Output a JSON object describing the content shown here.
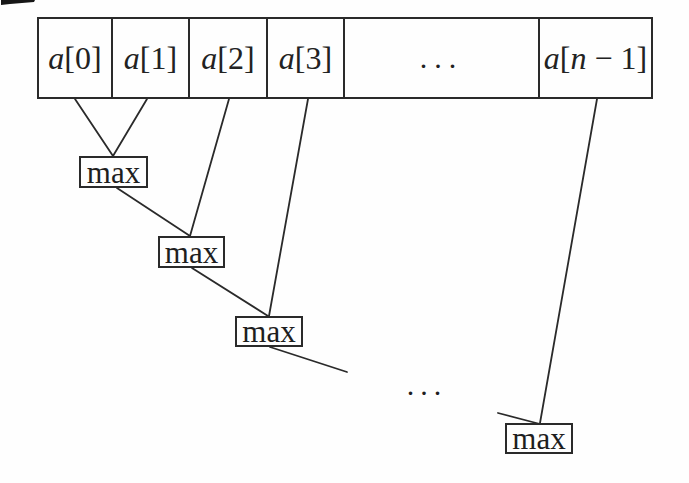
{
  "diagram": {
    "array": {
      "cells": [
        {
          "label": "a[0]"
        },
        {
          "label": "a[1]"
        },
        {
          "label": "a[2]"
        },
        {
          "label": "a[3]"
        },
        {
          "label": "..."
        },
        {
          "label": "a[n − 1]"
        }
      ]
    },
    "max_nodes": [
      {
        "label": "max"
      },
      {
        "label": "max"
      },
      {
        "label": "max"
      },
      {
        "label": "max"
      }
    ],
    "chain_ellipsis": "...",
    "edges": [
      {
        "from": "a[0]",
        "to": "max-1"
      },
      {
        "from": "a[1]",
        "to": "max-1"
      },
      {
        "from": "a[2]",
        "to": "max-2"
      },
      {
        "from": "max-1",
        "to": "max-2"
      },
      {
        "from": "a[3]",
        "to": "max-3"
      },
      {
        "from": "max-2",
        "to": "max-3"
      },
      {
        "from": "max-3",
        "to": "ellipsis"
      },
      {
        "from": "ellipsis",
        "to": "max-4"
      },
      {
        "from": "a[n − 1]",
        "to": "max-4"
      }
    ],
    "colors": {
      "ink": "#2a2a2a",
      "background": "#fefefe"
    }
  }
}
